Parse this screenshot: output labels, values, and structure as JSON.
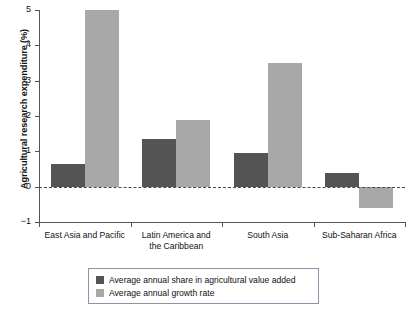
{
  "chart_data": {
    "type": "bar",
    "title": "",
    "xlabel": "",
    "ylabel": "Agricultural research expenditure (%)",
    "ylim": [
      -1,
      5
    ],
    "yticks": [
      5,
      4,
      3,
      2,
      1,
      0,
      -1
    ],
    "ytick_labels": [
      "5",
      "4",
      "3",
      "2",
      "1",
      "0",
      "−1"
    ],
    "grid": false,
    "zero_line": true,
    "legend_position": "bottom",
    "categories": [
      "East Asia and Pacific",
      "Latin America and the Caribbean",
      "South Asia",
      "Sub-Saharan Africa"
    ],
    "category_lines": [
      [
        "East Asia and Pacific"
      ],
      [
        "Latin America and",
        "the Caribbean"
      ],
      [
        "South Asia"
      ],
      [
        "Sub-Saharan Africa"
      ]
    ],
    "series": [
      {
        "name": "Average annual share in agricultural value added",
        "color": "#545454",
        "values": [
          0.65,
          1.35,
          0.95,
          0.4
        ]
      },
      {
        "name": "Average annual growth rate",
        "color": "#a8a8a8",
        "values": [
          5.0,
          1.9,
          3.5,
          -0.6
        ]
      }
    ]
  },
  "legend": {
    "items": [
      {
        "label": "Average annual share in agricultural value added",
        "swatch": "dark"
      },
      {
        "label": "Average annual growth rate",
        "swatch": "light"
      }
    ]
  },
  "colors": {
    "series_dark": "#545454",
    "series_light": "#a8a8a8",
    "axis": "#555555",
    "legend_border": "#8a96a8",
    "background": "#ffffff"
  }
}
